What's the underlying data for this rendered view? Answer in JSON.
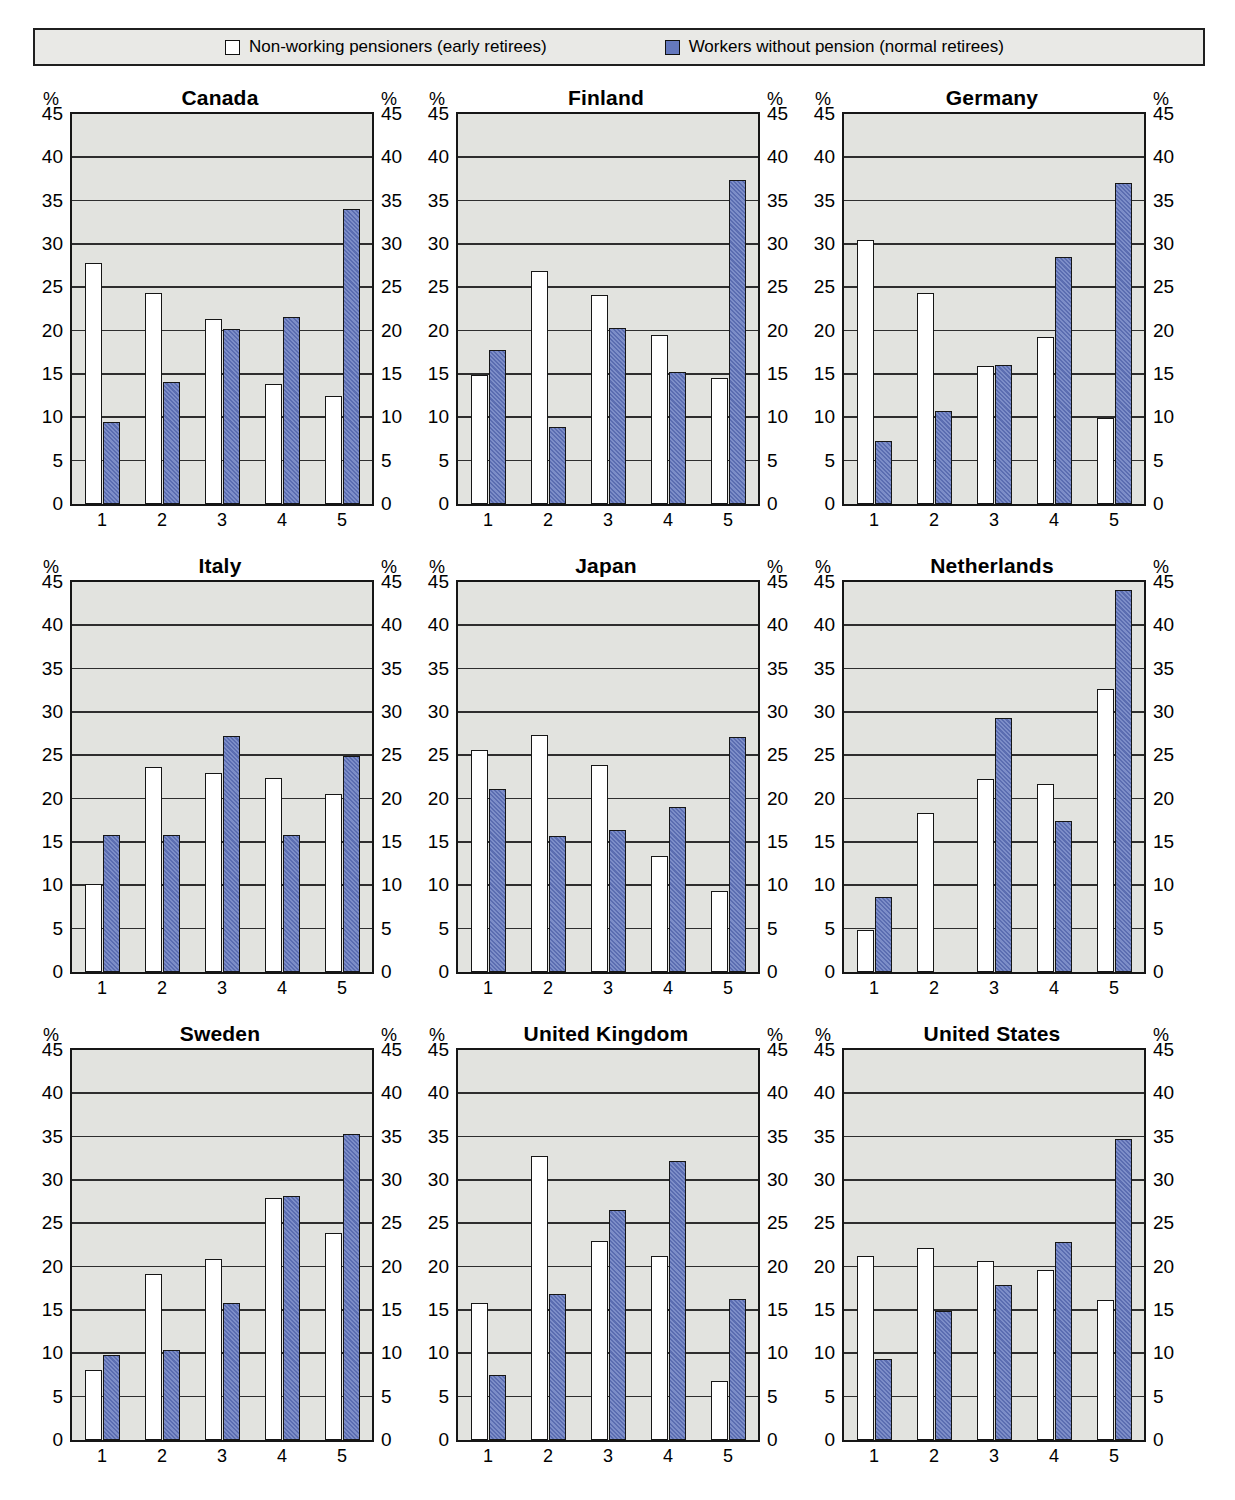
{
  "legend": {
    "items": [
      {
        "label": "Non-working pensioners (early retirees)",
        "swatch_color": "#ffffff"
      },
      {
        "label": "Workers without pension (normal retirees)",
        "swatch_color": "#6478be"
      }
    ],
    "background": "#e9e9e6",
    "border_color": "#1f1f1f"
  },
  "colors": {
    "plot_background": "#e2e3df",
    "gridline": "#2e2e2e",
    "bar_border": "#161616",
    "series1_fill": "#ffffff",
    "series2_fill": "#6478be",
    "text": "#000000"
  },
  "axes": {
    "y_unit": "%",
    "ylim": [
      0,
      45
    ],
    "ytick_step": 5,
    "categories": [
      "1",
      "2",
      "3",
      "4",
      "5"
    ],
    "grid": true
  },
  "chart_data": [
    {
      "type": "bar",
      "title": "Canada",
      "categories": [
        "1",
        "2",
        "3",
        "4",
        "5"
      ],
      "ylim": [
        0,
        45
      ],
      "ytick_step": 5,
      "y_unit": "%",
      "grid": true,
      "series": [
        {
          "name": "Non-working pensioners (early retirees)",
          "values": [
            27.8,
            24.3,
            21.3,
            13.8,
            12.5
          ]
        },
        {
          "name": "Workers without pension (normal retirees)",
          "values": [
            9.5,
            14.1,
            20.2,
            21.6,
            34.0
          ]
        }
      ]
    },
    {
      "type": "bar",
      "title": "Finland",
      "categories": [
        "1",
        "2",
        "3",
        "4",
        "5"
      ],
      "ylim": [
        0,
        45
      ],
      "ytick_step": 5,
      "y_unit": "%",
      "grid": true,
      "series": [
        {
          "name": "Non-working pensioners (early retirees)",
          "values": [
            14.9,
            26.9,
            24.1,
            19.5,
            14.5
          ]
        },
        {
          "name": "Workers without pension (normal retirees)",
          "values": [
            17.8,
            8.9,
            20.3,
            15.2,
            37.4
          ]
        }
      ]
    },
    {
      "type": "bar",
      "title": "Germany",
      "categories": [
        "1",
        "2",
        "3",
        "4",
        "5"
      ],
      "ylim": [
        0,
        45
      ],
      "ytick_step": 5,
      "y_unit": "%",
      "grid": true,
      "series": [
        {
          "name": "Non-working pensioners (early retirees)",
          "values": [
            30.5,
            24.3,
            15.9,
            19.3,
            9.9
          ]
        },
        {
          "name": "Workers without pension (normal retirees)",
          "values": [
            7.3,
            10.7,
            16.0,
            28.5,
            37.0
          ]
        }
      ]
    },
    {
      "type": "bar",
      "title": "Italy",
      "categories": [
        "1",
        "2",
        "3",
        "4",
        "5"
      ],
      "ylim": [
        0,
        45
      ],
      "ytick_step": 5,
      "y_unit": "%",
      "grid": true,
      "series": [
        {
          "name": "Non-working pensioners (early retirees)",
          "values": [
            10.2,
            23.7,
            23.0,
            22.4,
            20.5
          ]
        },
        {
          "name": "Workers without pension (normal retirees)",
          "values": [
            15.8,
            15.8,
            27.2,
            15.8,
            24.9
          ]
        }
      ]
    },
    {
      "type": "bar",
      "title": "Japan",
      "categories": [
        "1",
        "2",
        "3",
        "4",
        "5"
      ],
      "ylim": [
        0,
        45
      ],
      "ytick_step": 5,
      "y_unit": "%",
      "grid": true,
      "series": [
        {
          "name": "Non-working pensioners (early retirees)",
          "values": [
            25.6,
            27.3,
            23.9,
            13.4,
            9.4
          ]
        },
        {
          "name": "Workers without pension (normal retirees)",
          "values": [
            21.1,
            15.7,
            16.4,
            19.0,
            27.1
          ]
        }
      ]
    },
    {
      "type": "bar",
      "title": "Netherlands",
      "categories": [
        "1",
        "2",
        "3",
        "4",
        "5"
      ],
      "ylim": [
        0,
        45
      ],
      "ytick_step": 5,
      "y_unit": "%",
      "grid": true,
      "series": [
        {
          "name": "Non-working pensioners (early retirees)",
          "values": [
            4.8,
            18.4,
            22.3,
            21.7,
            32.6
          ]
        },
        {
          "name": "Workers without pension (normal retirees)",
          "values": [
            8.7,
            null,
            29.3,
            17.4,
            44.1
          ]
        }
      ]
    },
    {
      "type": "bar",
      "title": "Sweden",
      "categories": [
        "1",
        "2",
        "3",
        "4",
        "5"
      ],
      "ylim": [
        0,
        45
      ],
      "ytick_step": 5,
      "y_unit": "%",
      "grid": true,
      "series": [
        {
          "name": "Non-working pensioners (early retirees)",
          "values": [
            8.1,
            19.1,
            20.9,
            27.9,
            23.9
          ]
        },
        {
          "name": "Workers without pension (normal retirees)",
          "values": [
            9.8,
            10.4,
            15.8,
            28.2,
            35.3
          ]
        }
      ]
    },
    {
      "type": "bar",
      "title": "United Kingdom",
      "categories": [
        "1",
        "2",
        "3",
        "4",
        "5"
      ],
      "ylim": [
        0,
        45
      ],
      "ytick_step": 5,
      "y_unit": "%",
      "grid": true,
      "series": [
        {
          "name": "Non-working pensioners (early retirees)",
          "values": [
            15.8,
            32.8,
            23.0,
            21.2,
            6.8
          ]
        },
        {
          "name": "Workers without pension (normal retirees)",
          "values": [
            7.5,
            16.9,
            26.5,
            32.2,
            16.3
          ]
        }
      ]
    },
    {
      "type": "bar",
      "title": "United States",
      "categories": [
        "1",
        "2",
        "3",
        "4",
        "5"
      ],
      "ylim": [
        0,
        45
      ],
      "ytick_step": 5,
      "y_unit": "%",
      "grid": true,
      "series": [
        {
          "name": "Non-working pensioners (early retirees)",
          "values": [
            21.2,
            22.1,
            20.6,
            19.6,
            16.2
          ]
        },
        {
          "name": "Workers without pension (normal retirees)",
          "values": [
            9.3,
            14.9,
            17.9,
            22.9,
            34.7
          ]
        }
      ]
    }
  ]
}
